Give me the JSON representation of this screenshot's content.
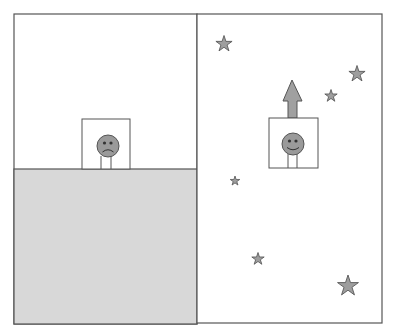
{
  "diagram": {
    "colors": {
      "background": "#ffffff",
      "line": "#555555",
      "ground": "#d8d8d8",
      "face": "#9a9a9a",
      "star": "#9e9e9e",
      "arrow": "#a0a0a0"
    },
    "panels": [
      {
        "id": "left",
        "label": "Ground scene",
        "figure": {
          "expression": "sad",
          "box": {
            "x": 82,
            "y": 119,
            "w": 48,
            "h": 50
          },
          "face": {
            "cx": 108,
            "cy": 146,
            "r": 11
          }
        },
        "ground": {
          "x": 14,
          "y": 169,
          "w": 183,
          "h": 155
        }
      },
      {
        "id": "right",
        "label": "Space scene",
        "figure": {
          "expression": "happy",
          "box": {
            "x": 269,
            "y": 118,
            "w": 49,
            "h": 50
          },
          "face": {
            "cx": 293,
            "cy": 144,
            "r": 11
          }
        },
        "arrow": {
          "direction": "up",
          "tip_x": 292,
          "tip_y": 80,
          "base_y": 118
        },
        "stars": [
          {
            "cx": 224,
            "cy": 44,
            "size": 17
          },
          {
            "cx": 357,
            "cy": 74,
            "size": 17
          },
          {
            "cx": 331,
            "cy": 96,
            "size": 13
          },
          {
            "cx": 235,
            "cy": 181,
            "size": 10
          },
          {
            "cx": 258,
            "cy": 259,
            "size": 13
          },
          {
            "cx": 348,
            "cy": 285,
            "size": 22
          }
        ]
      }
    ]
  }
}
